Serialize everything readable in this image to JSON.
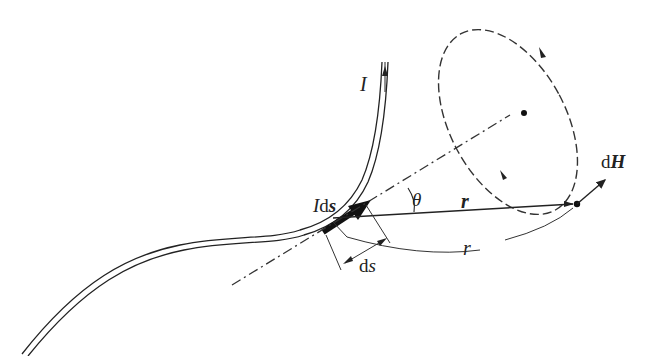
{
  "diagram": {
    "labels": {
      "current": "I",
      "current_element_I": "I",
      "current_element_ds": "ds",
      "theta": "θ",
      "r_vector": "r",
      "r_scalar": "r",
      "ds_length_d": "d",
      "ds_length_s": "s",
      "dH_d": "d",
      "dH_H": "H"
    },
    "elements": [
      "wire carrying current I (double line)",
      "current element I ds (bold arrow on wire)",
      "dash-dot axis line through current element",
      "dashed circular field line loop with direction arrows",
      "position vector r from element to field point",
      "arc labelled r showing distance",
      "angle θ between ds and r",
      "field point with vector dH tangent to loop"
    ],
    "colors": {
      "stroke": "#222222",
      "background": "#ffffff"
    }
  }
}
